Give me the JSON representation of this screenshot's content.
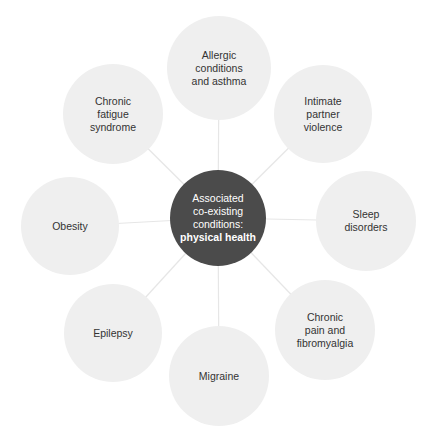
{
  "diagram": {
    "type": "hub-and-spoke",
    "colors": {
      "center_fill": "#4b4b4b",
      "center_text": "#ffffff",
      "outer_fill": "#efefef",
      "outer_text": "#333333",
      "connector": "#e6e6e6"
    },
    "center": {
      "lines": [
        "Associated",
        "co-existing",
        "conditions:"
      ],
      "bold_line": "physical health",
      "cx": 218,
      "cy": 218,
      "r": 48
    },
    "nodes": [
      {
        "id": "allergic",
        "lines": [
          "Allergic",
          "conditions",
          "and asthma"
        ],
        "cx": 219,
        "cy": 68,
        "r": 52
      },
      {
        "id": "ipv",
        "lines": [
          "Intimate",
          "partner",
          "violence"
        ],
        "cx": 323,
        "cy": 114,
        "r": 49
      },
      {
        "id": "sleep",
        "lines": [
          "Sleep",
          "disorders"
        ],
        "cx": 366,
        "cy": 221,
        "r": 50
      },
      {
        "id": "chronic-pain",
        "lines": [
          "Chronic",
          "pain and",
          "fibromyalgia"
        ],
        "cx": 325,
        "cy": 330,
        "r": 50
      },
      {
        "id": "migraine",
        "lines": [
          "Migraine"
        ],
        "cx": 219,
        "cy": 376,
        "r": 50
      },
      {
        "id": "epilepsy",
        "lines": [
          "Epilepsy"
        ],
        "cx": 113,
        "cy": 333,
        "r": 49
      },
      {
        "id": "obesity",
        "lines": [
          "Obesity"
        ],
        "cx": 70,
        "cy": 226,
        "r": 49
      },
      {
        "id": "cfs",
        "lines": [
          "Chronic",
          "fatigue",
          "syndrome"
        ],
        "cx": 113,
        "cy": 114,
        "r": 50
      }
    ]
  }
}
